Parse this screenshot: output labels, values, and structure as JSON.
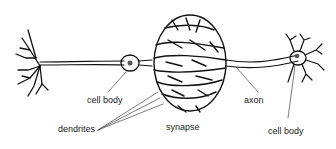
{
  "diagram": {
    "labels": {
      "cell_body_left": "cell body",
      "dendrites": "dendrites",
      "synapse": "synapse",
      "axon": "axon",
      "cell_body_right": "cell body"
    }
  }
}
